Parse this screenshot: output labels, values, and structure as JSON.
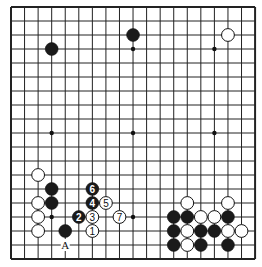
{
  "board": {
    "size": 19,
    "origin_x": 11,
    "origin_y": 7,
    "spacing_x": 13.56,
    "spacing_y": 14.0,
    "line_color": "#222222",
    "border_width": 2,
    "star_points": [
      [
        3,
        3
      ],
      [
        9,
        3
      ],
      [
        15,
        3
      ],
      [
        3,
        9
      ],
      [
        9,
        9
      ],
      [
        15,
        9
      ],
      [
        3,
        15
      ],
      [
        9,
        15
      ],
      [
        15,
        15
      ]
    ]
  },
  "stones": [
    {
      "color": "black",
      "col": 3,
      "row": 3,
      "label": ""
    },
    {
      "color": "black",
      "col": 9,
      "row": 2,
      "label": ""
    },
    {
      "color": "white",
      "col": 16,
      "row": 2,
      "label": ""
    },
    {
      "color": "white",
      "col": 2,
      "row": 12,
      "label": ""
    },
    {
      "color": "black",
      "col": 3,
      "row": 13,
      "label": ""
    },
    {
      "color": "black",
      "col": 3,
      "row": 14,
      "label": ""
    },
    {
      "color": "white",
      "col": 2,
      "row": 14,
      "label": ""
    },
    {
      "color": "white",
      "col": 2,
      "row": 15,
      "label": ""
    },
    {
      "color": "white",
      "col": 2,
      "row": 16,
      "label": ""
    },
    {
      "color": "black",
      "col": 4,
      "row": 16,
      "label": ""
    },
    {
      "color": "white",
      "col": 6,
      "row": 16,
      "label": "1"
    },
    {
      "color": "black",
      "col": 5,
      "row": 15,
      "label": "2"
    },
    {
      "color": "white",
      "col": 6,
      "row": 15,
      "label": "3"
    },
    {
      "color": "black",
      "col": 6,
      "row": 14,
      "label": "4"
    },
    {
      "color": "white",
      "col": 7,
      "row": 14,
      "label": "5"
    },
    {
      "color": "black",
      "col": 6,
      "row": 13,
      "label": "6"
    },
    {
      "color": "white",
      "col": 8,
      "row": 15,
      "label": "7"
    },
    {
      "color": "white",
      "col": 13,
      "row": 14,
      "label": ""
    },
    {
      "color": "white",
      "col": 16,
      "row": 14,
      "label": ""
    },
    {
      "color": "black",
      "col": 12,
      "row": 15,
      "label": ""
    },
    {
      "color": "black",
      "col": 13,
      "row": 15,
      "label": ""
    },
    {
      "color": "white",
      "col": 14,
      "row": 15,
      "label": ""
    },
    {
      "color": "white",
      "col": 15,
      "row": 15,
      "label": ""
    },
    {
      "color": "black",
      "col": 16,
      "row": 15,
      "label": ""
    },
    {
      "color": "black",
      "col": 12,
      "row": 16,
      "label": ""
    },
    {
      "color": "white",
      "col": 13,
      "row": 16,
      "label": ""
    },
    {
      "color": "black",
      "col": 14,
      "row": 16,
      "label": ""
    },
    {
      "color": "black",
      "col": 15,
      "row": 16,
      "label": ""
    },
    {
      "color": "white",
      "col": 16,
      "row": 16,
      "label": ""
    },
    {
      "color": "white",
      "col": 17,
      "row": 16,
      "label": ""
    },
    {
      "color": "black",
      "col": 12,
      "row": 17,
      "label": ""
    },
    {
      "color": "white",
      "col": 13,
      "row": 17,
      "label": ""
    },
    {
      "color": "black",
      "col": 14,
      "row": 17,
      "label": ""
    },
    {
      "color": "black",
      "col": 16,
      "row": 17,
      "label": ""
    }
  ],
  "markers": [
    {
      "type": "letter",
      "col": 4,
      "row": 17,
      "text": "A"
    }
  ]
}
